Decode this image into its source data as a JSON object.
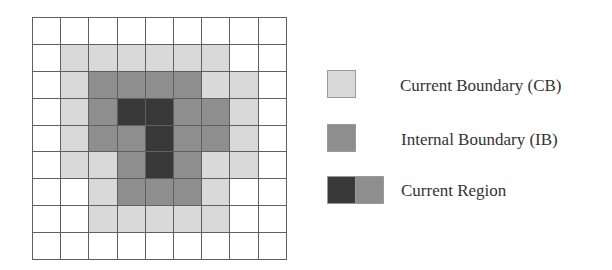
{
  "diagram": {
    "grid": {
      "rows": 9,
      "cols": 9,
      "legend_key": {
        "0": "empty",
        "1": "current-boundary",
        "2": "internal-boundary",
        "3": "current-region-core"
      },
      "cells": [
        [
          0,
          0,
          0,
          0,
          0,
          0,
          0,
          0,
          0
        ],
        [
          0,
          1,
          1,
          1,
          1,
          1,
          1,
          0,
          0
        ],
        [
          0,
          1,
          2,
          2,
          2,
          2,
          1,
          1,
          0
        ],
        [
          0,
          1,
          2,
          3,
          3,
          2,
          2,
          1,
          0
        ],
        [
          0,
          1,
          2,
          2,
          3,
          2,
          2,
          1,
          0
        ],
        [
          0,
          1,
          1,
          2,
          3,
          2,
          1,
          1,
          0
        ],
        [
          0,
          0,
          1,
          2,
          2,
          2,
          1,
          0,
          0
        ],
        [
          0,
          0,
          1,
          1,
          1,
          1,
          1,
          0,
          0
        ],
        [
          0,
          0,
          0,
          0,
          0,
          0,
          0,
          0,
          0
        ]
      ]
    },
    "colors": {
      "empty": "#ffffff",
      "current_boundary": "#d9d9d9",
      "internal_boundary": "#8e8e8e",
      "current_region_core": "#393939",
      "grid_line": "#606060"
    },
    "legend": [
      {
        "label": "Current Boundary (CB)",
        "swatch": [
          "current-boundary"
        ]
      },
      {
        "label": "Internal Boundary (IB)",
        "swatch": [
          "internal-boundary"
        ]
      },
      {
        "label": "Current Region",
        "swatch": [
          "current-region-core",
          "internal-boundary"
        ]
      }
    ]
  }
}
